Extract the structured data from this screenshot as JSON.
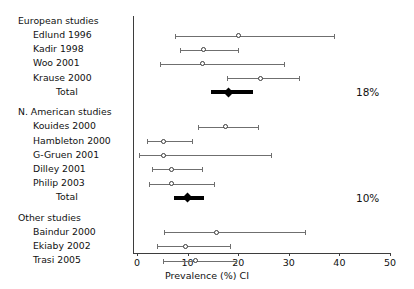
{
  "chart_data": {
    "type": "forest",
    "title": "",
    "xlabel": "Prevalence (%) CI",
    "ylabel": "",
    "xlim": [
      0,
      50
    ],
    "xticks": [
      0,
      10,
      20,
      30,
      40,
      50
    ],
    "xtick_labels": [
      "0",
      "10",
      "20",
      "30",
      "40",
      "50"
    ],
    "grid": false,
    "legend": "none",
    "groups": [
      {
        "name": "European studies",
        "studies": [
          {
            "label": "Edlund 1996",
            "estimate": 20.0,
            "ci_low": 7.5,
            "ci_high": 39.0
          },
          {
            "label": "Kadir 1998",
            "estimate": 13.2,
            "ci_low": 8.5,
            "ci_high": 20.0
          },
          {
            "label": "Woo 2001",
            "estimate": 13.0,
            "ci_low": 4.5,
            "ci_high": 29.0
          },
          {
            "label": "Krause 2000",
            "estimate": 24.5,
            "ci_low": 17.8,
            "ci_high": 32.0
          }
        ],
        "summary": {
          "label": "Total",
          "estimate": 18.0,
          "ci_low": 14.6,
          "ci_high": 23.0,
          "annotation": "18%"
        }
      },
      {
        "name": "N. American studies",
        "studies": [
          {
            "label": "Kouides 2000",
            "estimate": 17.5,
            "ci_low": 12.0,
            "ci_high": 24.0
          },
          {
            "label": "Hambleton 2000",
            "estimate": 5.2,
            "ci_low": 2.0,
            "ci_high": 10.8
          },
          {
            "label": "G-Gruen 2001",
            "estimate": 5.3,
            "ci_low": 0.3,
            "ci_high": 26.5
          },
          {
            "label": "Dilley 2001",
            "estimate": 6.8,
            "ci_low": 3.0,
            "ci_high": 12.8
          },
          {
            "label": "Philip 2003",
            "estimate": 6.8,
            "ci_low": 2.3,
            "ci_high": 15.3
          }
        ],
        "summary": {
          "label": "Total",
          "estimate": 10.0,
          "ci_low": 7.3,
          "ci_high": 13.2,
          "annotation": "10%"
        }
      },
      {
        "name": "Other studies",
        "studies": [
          {
            "label": "Baindur 2000",
            "estimate": 15.8,
            "ci_low": 5.3,
            "ci_high": 33.3
          },
          {
            "label": "Ekiaby 2002",
            "estimate": 9.5,
            "ci_low": 4.0,
            "ci_high": 18.3
          },
          {
            "label": "Trasi 2005",
            "estimate": 11.5,
            "ci_low": 5.2,
            "ci_high": 19.5
          }
        ],
        "summary": null
      }
    ]
  },
  "colors": {
    "axis": "#3d3d3d",
    "ci": "#6f6f6f",
    "marker_edge": "#3a3a3a",
    "marker_fill": "#ffffff",
    "summary": "#000000",
    "text": "#111111",
    "background": "#ffffff"
  }
}
